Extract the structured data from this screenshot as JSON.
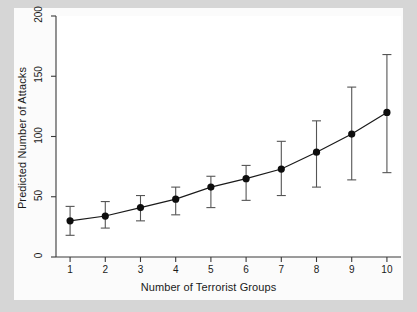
{
  "chart_data": {
    "type": "line",
    "title": "",
    "subtitle": "",
    "xlabel": "Number of Terrorist Groups",
    "ylabel": "Predicted Number of Attacks",
    "x": [
      1,
      2,
      3,
      4,
      5,
      6,
      7,
      8,
      9,
      10
    ],
    "xtick_labels": [
      "1",
      "2",
      "3",
      "4",
      "5",
      "6",
      "7",
      "8",
      "9",
      "10"
    ],
    "ytick_labels": [
      "0",
      "50",
      "100",
      "150",
      "200"
    ],
    "yticks": [
      0,
      50,
      100,
      150,
      200
    ],
    "xlim": [
      0.6,
      10.4
    ],
    "ylim": [
      0,
      200
    ],
    "grid": false,
    "legend": null,
    "marker": "filled-circle",
    "series": [
      {
        "name": "Predicted Number of Attacks",
        "values": [
          30,
          34,
          41,
          48,
          58,
          65,
          73,
          87,
          102,
          120
        ],
        "ci_lower": [
          18,
          24,
          30,
          35,
          41,
          47,
          51,
          58,
          64,
          70
        ],
        "ci_upper": [
          42,
          46,
          51,
          58,
          67,
          76,
          96,
          113,
          141,
          168
        ]
      }
    ],
    "colors": {
      "line": "#1a1a1a",
      "marker": "#0d0d0d",
      "error_bar": "#444444",
      "axis": "#3a3a3a",
      "plot_background": "#ffffff",
      "figure_background": "#fbfbfb",
      "outer_background": "#d6d6d6"
    }
  },
  "axes": {
    "x_title": "Number of Terrorist Groups",
    "y_title": "Predicted Number of Attacks"
  }
}
